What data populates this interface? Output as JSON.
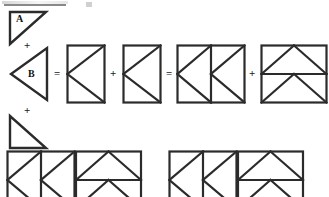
{
  "document": {
    "kind": "geometry-dissection-diagram",
    "title": "",
    "stroke_color": "#2b2b2b",
    "background_color": "#ffffff",
    "label_color": "#111111"
  },
  "labels": {
    "a_top": "A",
    "b": "B",
    "a_bottom": "A"
  },
  "operators": {
    "plus_1": "+",
    "equals_1": "=",
    "plus_2": "+",
    "equals_2": "=",
    "plus_3": "+",
    "plus_bottom": "+"
  },
  "rows": [
    {
      "name": "equation-row",
      "terms": [
        {
          "name": "triangle-a",
          "label": "A",
          "shape": "right-triangle-corner-top-left"
        },
        {
          "name": "triangle-b",
          "label": "B",
          "shape": "triangle-pointing-left"
        },
        {
          "name": "k-rectangle-1",
          "shape": "rectangle-with-k-diagonals"
        },
        {
          "name": "k-rectangle-2",
          "shape": "rectangle-with-k-diagonals"
        },
        {
          "name": "double-k-square",
          "shape": "square-two-k-rectangles"
        },
        {
          "name": "stacked-triangles-square",
          "shape": "square-split-horizontal-two-triangles"
        }
      ]
    },
    {
      "name": "bottom-row",
      "terms": [
        {
          "name": "triangle-a-bottom",
          "label": "A",
          "shape": "right-triangle-corner-bottom-left"
        },
        {
          "name": "bottom-left-group",
          "shape": "double-k-plus-stacked-triangles"
        },
        {
          "name": "bottom-right-group",
          "shape": "double-k-plus-stacked-triangles"
        }
      ]
    }
  ],
  "notes": {
    "clipping": "bottom row shapes are cropped by the image bottom edge",
    "top_artifact": "faint cropped text smudge along the top edge"
  }
}
